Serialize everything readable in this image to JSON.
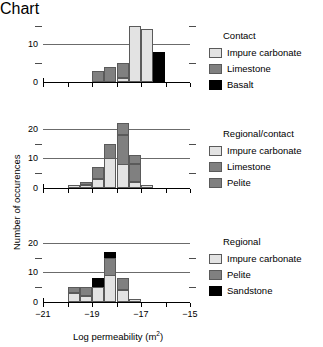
{
  "axes": {
    "ylabel": "Number of occurences",
    "xlabel_prefix": "Log permeability (m",
    "xlabel_sup": "2",
    "xlabel_suffix": ")",
    "xticks": [
      "-21",
      "-19",
      "-17",
      "-15"
    ],
    "xtick_values": [
      -21,
      -19,
      -17,
      -15
    ],
    "xlim": [
      -21,
      -15
    ],
    "minor_xticks": [
      -20,
      -18,
      -16
    ]
  },
  "colors": {
    "impure_carbonate": "#e3e3e3",
    "limestone": "#808080",
    "pelite": "#808080",
    "basalt": "#000000",
    "sandstone": "#000000",
    "gridline": "#6b6b6b",
    "axis": "#000000",
    "background": "#ffffff"
  },
  "panels": [
    {
      "legend_title": "Contact",
      "yticks": [
        "0",
        "10"
      ],
      "ytick_values": [
        0,
        10
      ],
      "minor_yticks": [
        5,
        15
      ],
      "ylim": [
        0,
        17
      ],
      "legend": [
        {
          "label": "Impure carbonate",
          "key": "impure_carbonate"
        },
        {
          "label": "Limestone",
          "key": "limestone"
        },
        {
          "label": "Basalt",
          "key": "basalt"
        }
      ]
    },
    {
      "legend_title": "Regional/contact",
      "yticks": [
        "0",
        "10",
        "20"
      ],
      "ytick_values": [
        0,
        10,
        20
      ],
      "minor_yticks": [
        5,
        15
      ],
      "ylim": [
        0,
        23
      ],
      "legend": [
        {
          "label": "Impure carbonate",
          "key": "impure_carbonate"
        },
        {
          "label": "Limestone",
          "key": "limestone"
        },
        {
          "label": "Pelite",
          "key": "pelite"
        }
      ]
    },
    {
      "legend_title": "Regional",
      "yticks": [
        "0",
        "10",
        "20"
      ],
      "ytick_values": [
        0,
        10,
        20
      ],
      "minor_yticks": [
        5,
        15
      ],
      "ylim": [
        0,
        23
      ],
      "legend": [
        {
          "label": "Impure carbonate",
          "key": "impure_carbonate"
        },
        {
          "label": "Pelite",
          "key": "pelite"
        },
        {
          "label": "Sandstone",
          "key": "sandstone"
        }
      ]
    }
  ],
  "chart_data": [
    {
      "type": "bar",
      "title": "Contact",
      "stacked": true,
      "xlabel": "Log permeability (m2)",
      "ylabel": "Number of occurences",
      "xlim": [
        -21,
        -15
      ],
      "ylim": [
        0,
        17
      ],
      "bin_width": 0.5,
      "bin_starts": [
        -19.0,
        -18.5,
        -18.0,
        -17.5,
        -17.0
      ],
      "series": [
        {
          "name": "Impure carbonate",
          "values": [
            0,
            0,
            1,
            15,
            14
          ]
        },
        {
          "name": "Limestone",
          "values": [
            3,
            4,
            4,
            0,
            0
          ]
        },
        {
          "name": "Basalt",
          "values": [
            0,
            0,
            0,
            0,
            0
          ]
        }
      ],
      "extra_bars": [
        {
          "bin_start": -16.5,
          "series": "Basalt",
          "value": 8
        }
      ],
      "grid": "horizontal",
      "legend_position": "right"
    },
    {
      "type": "bar",
      "title": "Regional/contact",
      "stacked": true,
      "xlabel": "Log permeability (m2)",
      "ylabel": "Number of occurences",
      "xlim": [
        -21,
        -15
      ],
      "ylim": [
        0,
        23
      ],
      "bin_width": 0.5,
      "bin_starts": [
        -20.0,
        -19.5,
        -19.0,
        -18.5,
        -18.0,
        -17.5,
        -17.0
      ],
      "series": [
        {
          "name": "Impure carbonate",
          "values": [
            1,
            1,
            3,
            10,
            8,
            2,
            1
          ]
        },
        {
          "name": "Limestone",
          "values": [
            0,
            1,
            4,
            5,
            10,
            6,
            0
          ]
        },
        {
          "name": "Pelite",
          "values": [
            0,
            0,
            0,
            0,
            4,
            3,
            0
          ]
        }
      ],
      "grid": "horizontal",
      "legend_position": "right"
    },
    {
      "type": "bar",
      "title": "Regional",
      "stacked": true,
      "xlabel": "Log permeability (m2)",
      "ylabel": "Number of occurences",
      "xlim": [
        -21,
        -15
      ],
      "ylim": [
        0,
        23
      ],
      "bin_width": 0.5,
      "bin_starts": [
        -20.0,
        -19.5,
        -19.0,
        -18.5,
        -18.0,
        -17.5
      ],
      "series": [
        {
          "name": "Impure carbonate",
          "values": [
            3,
            2,
            5,
            9,
            4,
            1
          ]
        },
        {
          "name": "Pelite",
          "values": [
            2,
            3,
            0,
            6,
            4,
            0
          ]
        },
        {
          "name": "Sandstone",
          "values": [
            0,
            0,
            3,
            2,
            0,
            0
          ]
        }
      ],
      "grid": "horizontal",
      "legend_position": "right"
    }
  ]
}
